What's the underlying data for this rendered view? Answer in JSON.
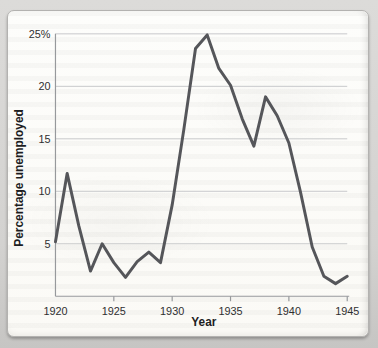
{
  "page": {
    "background_color": "#d3d2d0",
    "card_background": "#fbfaf6",
    "card_border_color": "#b3b2b0"
  },
  "chart_data": {
    "type": "line",
    "title": "",
    "xlabel": "Year",
    "ylabel": "Percentage unemployed",
    "x": [
      1920,
      1921,
      1922,
      1923,
      1924,
      1925,
      1926,
      1927,
      1928,
      1929,
      1930,
      1931,
      1932,
      1933,
      1934,
      1935,
      1936,
      1937,
      1938,
      1939,
      1940,
      1941,
      1942,
      1943,
      1944,
      1945
    ],
    "values": [
      5.2,
      11.7,
      6.7,
      2.4,
      5.0,
      3.2,
      1.8,
      3.3,
      4.2,
      3.2,
      8.7,
      15.9,
      23.6,
      24.9,
      21.7,
      20.1,
      16.9,
      14.3,
      19.0,
      17.2,
      14.6,
      9.9,
      4.7,
      1.9,
      1.2,
      1.9
    ],
    "xlim": [
      1920,
      1945
    ],
    "ylim": [
      0,
      25
    ],
    "x_ticks": [
      {
        "year": 1920,
        "label": "1920",
        "mark": false
      },
      {
        "year": 1925,
        "label": "1925",
        "mark": true
      },
      {
        "year": 1930,
        "label": "1930",
        "mark": true
      },
      {
        "year": 1935,
        "label": "1935",
        "mark": true
      },
      {
        "year": 1940,
        "label": "1940",
        "mark": true
      },
      {
        "year": 1945,
        "label": "1945",
        "mark": true
      }
    ],
    "y_ticks": [
      {
        "value": 5,
        "label": "5"
      },
      {
        "value": 10,
        "label": "10"
      },
      {
        "value": 15,
        "label": "15"
      },
      {
        "value": 20,
        "label": "20"
      },
      {
        "value": 25,
        "label": "25%"
      }
    ],
    "grid": "horizontal",
    "legend": "none",
    "series_name": "Percentage unemployed",
    "colors": {
      "line": "#55565a",
      "grid": "#c7c8ca",
      "axis": "#97999c",
      "tick_text": "#2f2f30",
      "title_text": "#1d1d1f"
    }
  }
}
